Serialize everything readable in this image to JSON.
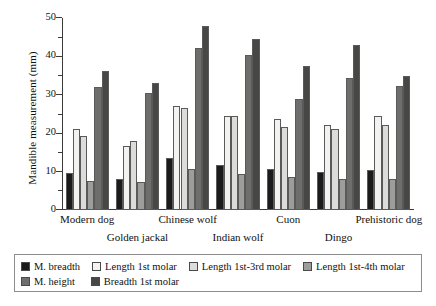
{
  "chart_data": {
    "type": "bar",
    "title": "",
    "xlabel": "",
    "ylabel": "Mandible measurement (mm)",
    "ylim": [
      0,
      50
    ],
    "ytick_labels": [
      "0",
      "10",
      "20",
      "30",
      "40",
      "50"
    ],
    "ytick_values": [
      0,
      10,
      20,
      30,
      40,
      50
    ],
    "yminor_values": [
      5,
      15,
      25,
      35,
      45
    ],
    "grid": false,
    "legend_position": "below",
    "categories": [
      "Modern dog",
      "Golden jackal",
      "Chinese wolf",
      "Indian wolf",
      "Cuon",
      "Dingo",
      "Prehistoric dog"
    ],
    "series": [
      {
        "name": "M. breadth",
        "color": "#1b1b1b",
        "values": [
          9.7,
          8.1,
          13.5,
          11.8,
          10.7,
          9.8,
          10.3
        ]
      },
      {
        "name": "Length 1st molar",
        "color": "#f2f2f0",
        "values": [
          21.2,
          16.7,
          27.2,
          24.5,
          23.8,
          22.2,
          24.5
        ]
      },
      {
        "name": "Length 1st-3rd molar",
        "color": "#dcdcda",
        "values": [
          19.4,
          18.0,
          26.6,
          24.4,
          21.6,
          21.1,
          22.2
        ]
      },
      {
        "name": "Length 1st-4th molar",
        "color": "#9d9d9b",
        "values": [
          7.6,
          7.2,
          10.8,
          9.5,
          8.5,
          8.0,
          8.0
        ]
      },
      {
        "name": "M. height",
        "color": "#6e6e6c",
        "values": [
          32.0,
          30.4,
          42.3,
          40.3,
          29.0,
          34.5,
          32.3
        ]
      },
      {
        "name": "Breadth 1st molar",
        "color": "#474745",
        "values": [
          36.3,
          33.1,
          48.0,
          44.5,
          37.6,
          43.0,
          35.0
        ]
      }
    ]
  },
  "axis": {
    "y_title": "Mandible measurement (mm)"
  },
  "legend": {
    "row1": [
      {
        "label": "M. breadth",
        "color": "#1b1b1b"
      },
      {
        "label": "Length 1st molar",
        "color": "#f2f2f0"
      },
      {
        "label": "Length 1st-3rd molar",
        "color": "#dcdcda"
      },
      {
        "label": "Length 1st-4th molar",
        "color": "#9d9d9b"
      }
    ],
    "row2": [
      {
        "label": "M. height",
        "color": "#6e6e6c"
      },
      {
        "label": "Breadth 1st molar",
        "color": "#474745"
      }
    ]
  }
}
